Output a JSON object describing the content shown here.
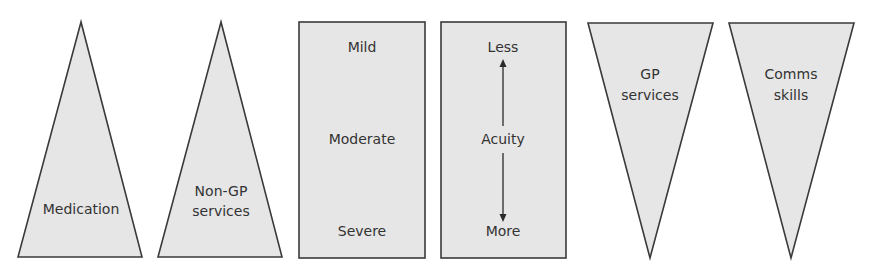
{
  "diagram": {
    "colors": {
      "fill": "#e6e6e6",
      "stroke": "#3a3a3a",
      "text": "#333333"
    },
    "upward_triangles": [
      {
        "id": "medication",
        "lines": [
          "Medication"
        ]
      },
      {
        "id": "non-gp-services",
        "lines": [
          "Non-GP",
          "services"
        ]
      }
    ],
    "severity_box": {
      "top": "Mild",
      "middle": "Moderate",
      "bottom": "Severe"
    },
    "acuity_box": {
      "top": "Less",
      "middle": "Acuity",
      "bottom": "More",
      "arrow": "double-headed-vertical"
    },
    "downward_triangles": [
      {
        "id": "gp-services",
        "lines": [
          "GP",
          "services"
        ]
      },
      {
        "id": "comms-skills",
        "lines": [
          "Comms",
          "skills"
        ]
      }
    ]
  }
}
